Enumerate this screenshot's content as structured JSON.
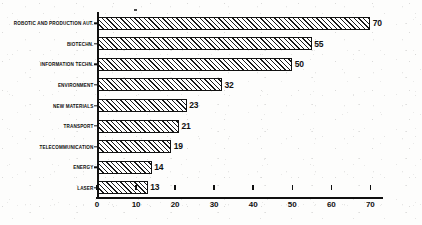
{
  "chart_data": {
    "type": "bar",
    "orientation": "horizontal",
    "title": "",
    "xlabel": "",
    "ylabel": "",
    "xlim": [
      0,
      73
    ],
    "xticks": [
      0,
      10,
      20,
      30,
      40,
      50,
      60,
      70
    ],
    "grid": false,
    "legend": null,
    "categories": [
      "ROBOTIC AND PRODUCTION AUT.",
      "BIOTECHN.",
      "INFORMATION TECHN.",
      "ENVIRONMENT",
      "NEW MATERIALS",
      "TRANSPORT",
      "TELECOMMUNICATION",
      "ENERGY",
      "LASER"
    ],
    "values": [
      70,
      55,
      50,
      32,
      23,
      21,
      19,
      14,
      13
    ],
    "value_labels": [
      "70",
      "55",
      "50",
      "32",
      "23",
      "21",
      "19",
      "14",
      "13"
    ],
    "bar_fill": "diagonal-hatch",
    "bar_border_color": "#111111",
    "axis_color": "#101010",
    "background_color": "#fdfdfc"
  }
}
